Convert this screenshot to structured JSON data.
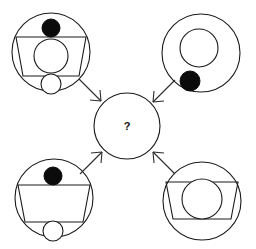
{
  "diagram": {
    "type": "visual-analogy-puzzle",
    "background_color": "#ffffff",
    "stroke_color": "#1a1a1a",
    "fill_color": "#0b0b0b",
    "center": {
      "label": "?",
      "shape": "circle",
      "cx": 127,
      "cy": 126,
      "r": 33
    },
    "panels": [
      {
        "id": "top-left",
        "position": "top-left",
        "circle": {
          "cx": 51,
          "cy": 52,
          "r": 39
        },
        "elements": [
          {
            "kind": "filled-circle",
            "cx": 51,
            "cy": 28,
            "r": 9
          },
          {
            "kind": "trapezoid",
            "top_y": 37,
            "bottom_y": 76,
            "top_half_width": 35,
            "bottom_half_width": 28
          },
          {
            "kind": "open-circle",
            "cx": 51,
            "cy": 56,
            "r": 17
          },
          {
            "kind": "open-circle",
            "cx": 51,
            "cy": 84,
            "r": 10
          }
        ]
      },
      {
        "id": "top-right",
        "position": "top-right",
        "circle": {
          "cx": 201,
          "cy": 53,
          "r": 39
        },
        "elements": [
          {
            "kind": "open-circle",
            "cx": 199,
            "cy": 48,
            "r": 19
          },
          {
            "kind": "filled-circle",
            "cx": 190,
            "cy": 81,
            "r": 10
          }
        ]
      },
      {
        "id": "bottom-left",
        "position": "bottom-left",
        "circle": {
          "cx": 54,
          "cy": 198,
          "r": 39
        },
        "elements": [
          {
            "kind": "filled-circle",
            "cx": 53,
            "cy": 176,
            "r": 9
          },
          {
            "kind": "trapezoid",
            "top_y": 185,
            "bottom_y": 222,
            "top_half_width": 36,
            "bottom_half_width": 29
          },
          {
            "kind": "open-circle",
            "cx": 53,
            "cy": 231,
            "r": 10
          }
        ]
      },
      {
        "id": "bottom-right",
        "position": "bottom-right",
        "circle": {
          "cx": 202,
          "cy": 201,
          "r": 39
        },
        "elements": [
          {
            "kind": "trapezoid",
            "top_y": 182,
            "bottom_y": 219,
            "top_half_width": 36,
            "bottom_half_width": 29
          },
          {
            "kind": "open-circle",
            "cx": 202,
            "cy": 199,
            "r": 20
          }
        ]
      }
    ],
    "arrows": [
      {
        "id": "arrow-top-left-to-center",
        "from": "top-left",
        "to": "center",
        "x1": 79,
        "y1": 79,
        "x2": 103,
        "y2": 103,
        "direction": "down-right"
      },
      {
        "id": "arrow-top-right-to-center",
        "from": "top-right",
        "to": "center",
        "x1": 175,
        "y1": 80,
        "x2": 151,
        "y2": 104,
        "direction": "down-left"
      },
      {
        "id": "arrow-bottom-left-to-center",
        "from": "bottom-left",
        "to": "center",
        "x1": 80,
        "y1": 174,
        "x2": 103,
        "y2": 150,
        "direction": "up-right"
      },
      {
        "id": "arrow-bottom-right-to-center",
        "from": "bottom-right",
        "to": "center",
        "x1": 175,
        "y1": 174,
        "x2": 152,
        "y2": 150,
        "direction": "up-left"
      }
    ]
  }
}
